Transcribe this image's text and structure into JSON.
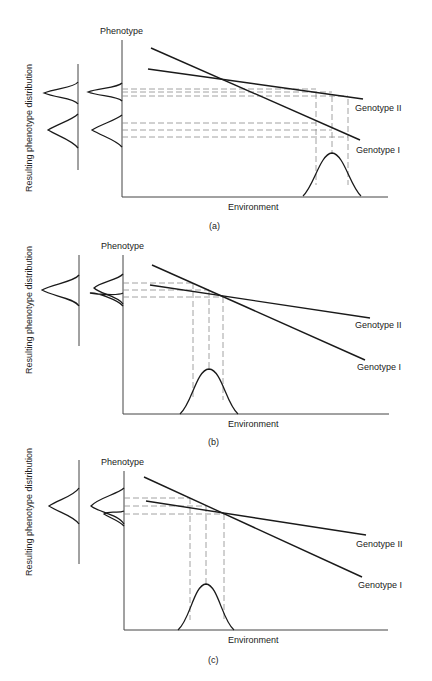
{
  "figure": {
    "panels": [
      {
        "id": "a",
        "caption": "(a)",
        "y_axis_label": "Phenotype",
        "x_axis_label": "Environment",
        "side_label": "Resulting phenotype distribution",
        "genotypes": [
          {
            "name": "Genotype II",
            "label": "Genotype II"
          },
          {
            "name": "Genotype I",
            "label": "Genotype I"
          }
        ],
        "description": "Environment distribution at high values; genotypes produce two distinct, separated phenotype distributions."
      },
      {
        "id": "b",
        "caption": "(b)",
        "y_axis_label": "Phenotype",
        "x_axis_label": "Environment",
        "side_label": "Resulting phenotype distribution",
        "genotypes": [
          {
            "name": "Genotype II",
            "label": "Genotype II"
          },
          {
            "name": "Genotype I",
            "label": "Genotype I"
          }
        ],
        "description": "Environment distribution near the crossing point; genotype phenotype distributions overlap into a single combined distribution."
      },
      {
        "id": "c",
        "caption": "(c)",
        "y_axis_label": "Phenotype",
        "x_axis_label": "Environment",
        "side_label": "Resulting phenotype distribution",
        "genotypes": [
          {
            "name": "Genotype II",
            "label": "Genotype II"
          },
          {
            "name": "Genotype I",
            "label": "Genotype I"
          }
        ],
        "description": "Environment distribution near the crossing point; the two genotype distributions overlap with a skewed combined result."
      }
    ]
  },
  "colors": {
    "line": "#1a1a1a",
    "dash": "#8a8a8a",
    "axis": "#444444",
    "background": "#ffffff"
  }
}
